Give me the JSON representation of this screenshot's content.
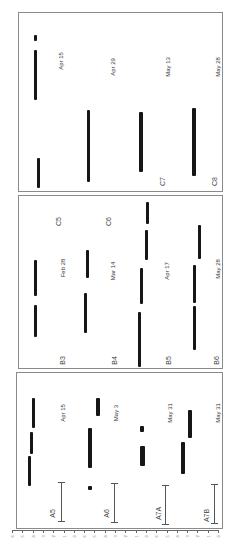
{
  "panels": {
    "C": {
      "lanes": [
        {
          "code": "C5",
          "date": "Apr 15"
        },
        {
          "code": "C6",
          "date": "Apr 29"
        },
        {
          "code": "C7",
          "date": "May 13"
        },
        {
          "code": "C8",
          "date": "May 28"
        }
      ]
    },
    "B": {
      "lanes": [
        {
          "code": "B3",
          "date": "Feb 28"
        },
        {
          "code": "B4",
          "date": "Mar 14"
        },
        {
          "code": "B5",
          "date": "Apr 17"
        },
        {
          "code": "B6",
          "date": "May 28"
        }
      ]
    },
    "A": {
      "lanes": [
        {
          "code": "A5",
          "date": "Apr 15"
        },
        {
          "code": "A6",
          "date": "May 3"
        },
        {
          "code": "A7A",
          "date": "May 31"
        },
        {
          "code": "A7B",
          "date": "May 31"
        }
      ]
    }
  },
  "ruler": {
    "tick_labels": [
      "6",
      "5",
      "4",
      "3",
      "2",
      "1",
      "0",
      "6",
      "5",
      "4",
      "3",
      "2",
      "1",
      "0",
      "6",
      "5",
      "4",
      "3",
      "2",
      "1",
      "0"
    ]
  }
}
